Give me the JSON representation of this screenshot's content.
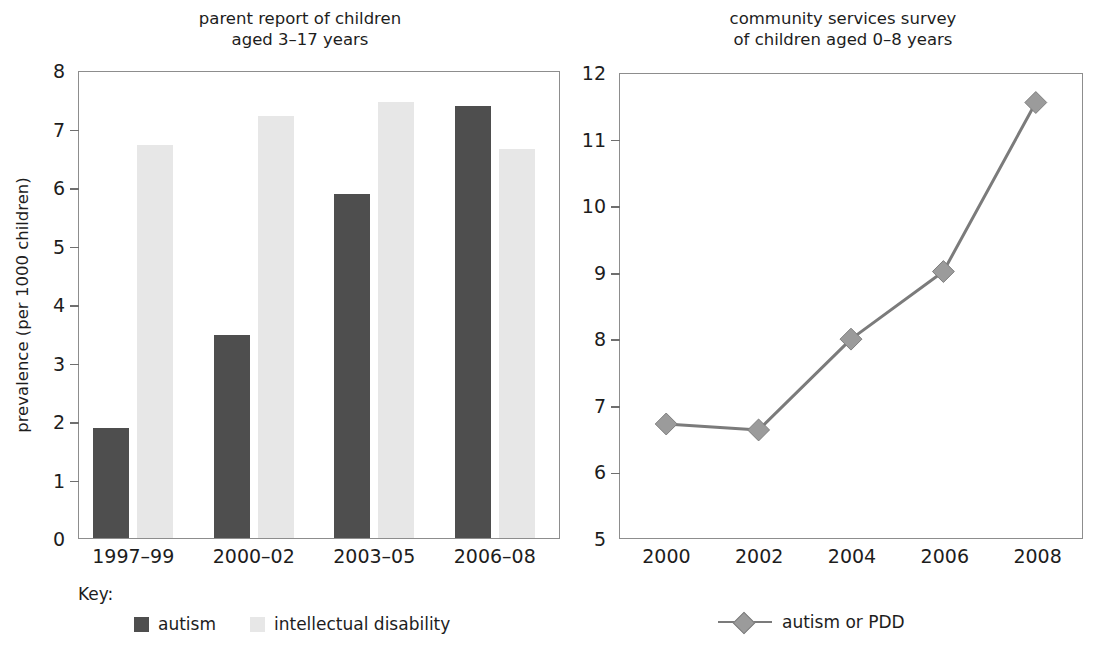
{
  "figure": {
    "panels": [
      {
        "id": "parent-report",
        "title": "parent report of children\naged 3–17 years"
      },
      {
        "id": "community-services",
        "title": "community services survey\nof children aged 0–8 years"
      }
    ]
  },
  "left_panel": {
    "title": "parent report of children\naged 3–17 years",
    "y_axis_title": "prevalence (per 1000 children)",
    "y_ticks": [
      "0",
      "1",
      "2",
      "3",
      "4",
      "5",
      "6",
      "7",
      "8"
    ],
    "x_ticks": [
      "1997–99",
      "2000–02",
      "2003–05",
      "2006–08"
    ],
    "key_label": "Key:",
    "legend": [
      {
        "label": "autism",
        "color": "#4e4e4e"
      },
      {
        "label": "intellectual disability",
        "color": "#e7e7e7"
      }
    ]
  },
  "right_panel": {
    "title": "community services survey\nof children aged 0–8 years",
    "y_ticks": [
      "5",
      "6",
      "7",
      "8",
      "9",
      "10",
      "11",
      "12"
    ],
    "x_ticks": [
      "2000",
      "2002",
      "2004",
      "2006",
      "2008"
    ],
    "legend": [
      {
        "label": "autism or PDD",
        "color": "#9b9b9b"
      }
    ]
  },
  "colors": {
    "autism_bar": "#4e4e4e",
    "intellectual_disability_bar": "#e7e7e7",
    "line_series": "#7b7b7b",
    "marker_fill": "#9b9b9b",
    "axis": "#8d8d8d",
    "text": "#1d1d1d"
  },
  "chart_data": [
    {
      "type": "bar",
      "title": "parent report of children aged 3–17 years",
      "xlabel": "",
      "ylabel": "prevalence (per 1000 children)",
      "ylim": [
        0,
        8
      ],
      "ytick_interval": 1,
      "grid": false,
      "legend_position": "below-left",
      "categories": [
        "1997–99",
        "2000–02",
        "2003–05",
        "2006–08"
      ],
      "series": [
        {
          "name": "autism",
          "color": "#4e4e4e",
          "values": [
            1.88,
            3.47,
            5.88,
            7.38
          ]
        },
        {
          "name": "intellectual disability",
          "color": "#e7e7e7",
          "values": [
            6.72,
            7.22,
            7.46,
            6.65
          ]
        }
      ]
    },
    {
      "type": "line",
      "title": "community services survey of children aged 0–8 years",
      "xlabel": "",
      "ylabel": "",
      "ylim": [
        5,
        12
      ],
      "ytick_interval": 1,
      "xlim": [
        1999,
        2009
      ],
      "grid": false,
      "legend_position": "below-center",
      "x": [
        2000,
        2002,
        2004,
        2006,
        2008
      ],
      "series": [
        {
          "name": "autism or PDD",
          "color": "#7b7b7b",
          "marker": "diamond",
          "values": [
            6.72,
            6.63,
            8.0,
            9.02,
            11.57
          ]
        }
      ]
    }
  ]
}
